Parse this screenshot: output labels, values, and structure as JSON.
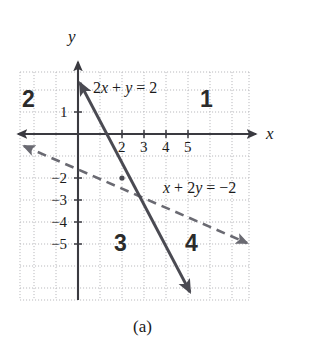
{
  "figure": {
    "caption": "(a)",
    "axis_labels": {
      "x": "x",
      "y": "y"
    },
    "x_ticks": [
      {
        "value": 2,
        "label": "2"
      },
      {
        "value": 3,
        "label": "3"
      },
      {
        "value": 4,
        "label": "4"
      },
      {
        "value": 5,
        "label": "5"
      }
    ],
    "y_ticks": [
      {
        "value": 1,
        "label": "1"
      },
      {
        "value": -2,
        "label": "−2"
      },
      {
        "value": -3,
        "label": "−3"
      },
      {
        "value": -4,
        "label": "−4"
      },
      {
        "value": -5,
        "label": "−5"
      }
    ],
    "quadrant_labels": [
      {
        "name": "1",
        "label": "1"
      },
      {
        "name": "2",
        "label": "2"
      },
      {
        "name": "3",
        "label": "3"
      },
      {
        "name": "4",
        "label": "4"
      }
    ],
    "equations": [
      {
        "id": "solid-line",
        "label_html": "2<i>x</i> + <i>y</i> = 2",
        "style": "solid"
      },
      {
        "id": "dashed-line",
        "label_html": "<i>x</i> + 2<i>y</i> = −2",
        "style": "dashed"
      }
    ],
    "colors": {
      "line": "#4a4a52",
      "axis": "#3a3a40",
      "grid": "#b9b9bd",
      "text": "#1a1a1a"
    }
  },
  "chart_data": {
    "type": "line",
    "title": "(a)",
    "xlabel": "x",
    "ylabel": "y",
    "xlim": [
      -3,
      8
    ],
    "ylim": [
      -6,
      2
    ],
    "grid": true,
    "legend": "inline-annotations",
    "series": [
      {
        "name": "2x + y = 2",
        "style": "solid",
        "slope": -2,
        "intercept": 2,
        "x_intercept": 1,
        "y_intercept": 2,
        "points": [
          [
            0,
            2
          ],
          [
            1,
            0
          ],
          [
            2,
            -2
          ],
          [
            5.2,
            -7.3
          ]
        ],
        "arrows": [
          "start",
          "end"
        ]
      },
      {
        "name": "x + 2y = -2",
        "style": "dashed",
        "slope": -0.5,
        "intercept": -1,
        "x_intercept": -2,
        "y_intercept": -1,
        "points": [
          [
            -2.5,
            0.25
          ],
          [
            -2,
            0
          ],
          [
            0,
            -1
          ],
          [
            2,
            -2
          ],
          [
            7.8,
            -4.9
          ]
        ],
        "arrows": [
          "start",
          "end"
        ]
      }
    ],
    "intersection": [
      2,
      -2
    ],
    "annotations": [
      {
        "text": "2x + y = 2",
        "x": 1.4,
        "y": 1.7
      },
      {
        "text": "x + 2y = -2",
        "x": 4.0,
        "y": -2.1
      },
      {
        "text": "1",
        "x": 6.2,
        "y": 1.3
      },
      {
        "text": "2",
        "x": -2.3,
        "y": 1.3
      },
      {
        "text": "3",
        "x": 2.0,
        "y": -4.6
      },
      {
        "text": "4",
        "x": 5.2,
        "y": -4.6
      }
    ]
  }
}
